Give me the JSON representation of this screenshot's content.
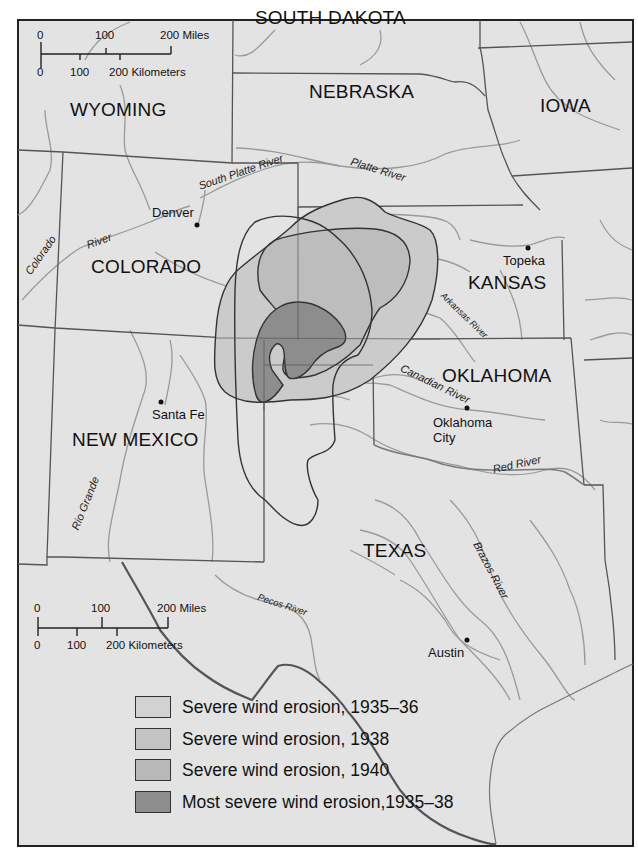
{
  "map": {
    "background": "#e3e3e3",
    "border_color": "#222222",
    "states": [
      {
        "name": "SOUTH DAKOTA",
        "x": 255,
        "y": 8
      },
      {
        "name": "WYOMING",
        "x": 70,
        "y": 100
      },
      {
        "name": "NEBRASKA",
        "x": 309,
        "y": 82
      },
      {
        "name": "IOWA",
        "x": 540,
        "y": 96
      },
      {
        "name": "COLORADO",
        "x": 91,
        "y": 257
      },
      {
        "name": "KANSAS",
        "x": 468,
        "y": 273
      },
      {
        "name": "OKLAHOMA",
        "x": 442,
        "y": 366
      },
      {
        "name": "NEW MEXICO",
        "x": 72,
        "y": 430
      },
      {
        "name": "TEXAS",
        "x": 363,
        "y": 541
      }
    ],
    "cities": [
      {
        "name": "Denver",
        "dot_x": 197,
        "dot_y": 225,
        "label_x": 152,
        "label_y": 206
      },
      {
        "name": "Topeka",
        "dot_x": 528,
        "dot_y": 248,
        "label_x": 503,
        "label_y": 254
      },
      {
        "name": "Santa Fe",
        "dot_x": 161,
        "dot_y": 402,
        "label_x": 152,
        "label_y": 408
      },
      {
        "name": "Oklahoma",
        "dot_x": 467,
        "dot_y": 408,
        "label_x": 433,
        "label_y": 416
      },
      {
        "name": "City",
        "dot_x": null,
        "dot_y": null,
        "label_x": 433,
        "label_y": 431
      },
      {
        "name": "Austin",
        "dot_x": 467,
        "dot_y": 640,
        "label_x": 428,
        "label_y": 646
      }
    ],
    "rivers": [
      {
        "name": "Platte River",
        "x": 351,
        "y": 156,
        "rotate": 17
      },
      {
        "name": "South Platte River",
        "x": 199,
        "y": 181,
        "rotate": -19
      },
      {
        "name": "Colorado",
        "x": 30,
        "y": 275,
        "rotate": -55
      },
      {
        "name": "River",
        "x": 88,
        "y": 233,
        "rotate": -20
      },
      {
        "name": "Arkansas River",
        "x": 440,
        "y": 297,
        "rotate": 44
      },
      {
        "name": "Canadian River",
        "x": 401,
        "y": 368,
        "rotate": 26
      },
      {
        "name": "Red River",
        "x": 493,
        "y": 464,
        "rotate": -12
      },
      {
        "name": "Rio Grande",
        "x": 81,
        "y": 525,
        "rotate": -68
      },
      {
        "name": "Pecos River",
        "x": 258,
        "y": 597,
        "rotate": 18
      },
      {
        "name": "Brazos River",
        "x": 478,
        "y": 542,
        "rotate": 62
      }
    ]
  },
  "scale_bars": [
    {
      "id": "top",
      "miles_labels": [
        "0",
        "100",
        "200 Miles"
      ],
      "km_labels": [
        "0",
        "100",
        "200 Kilometers"
      ]
    },
    {
      "id": "bottom",
      "miles_labels": [
        "0",
        "100",
        "200 Miles"
      ],
      "km_labels": [
        "0",
        "100",
        "200 Kilometers"
      ]
    }
  ],
  "legend": {
    "items": [
      {
        "label": "Severe wind erosion, 1935–36",
        "color": "#d2d2d2"
      },
      {
        "label": "Severe wind erosion, 1938",
        "color": "#c3c3c3"
      },
      {
        "label": "Severe wind erosion, 1940",
        "color": "#b9b9b9"
      },
      {
        "label": "Most severe wind erosion,1935–38",
        "color": "#8d8d8d"
      }
    ]
  }
}
